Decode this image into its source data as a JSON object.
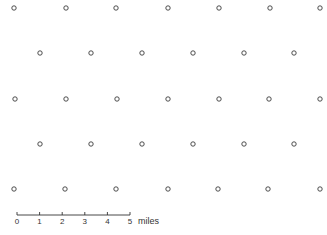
{
  "diagram": {
    "type": "point-pattern-map",
    "point_marker": "open-circle",
    "colors": {
      "point_stroke": "#3a3a3a",
      "background": "#ffffff"
    },
    "rows": [
      {
        "y": 8,
        "xs": [
          14,
          66,
          116,
          168,
          219,
          270,
          320
        ]
      },
      {
        "y": 53,
        "xs": [
          40,
          91,
          142,
          193,
          244,
          294
        ]
      },
      {
        "y": 99,
        "xs": [
          15,
          66,
          117,
          168,
          219,
          269,
          320
        ]
      },
      {
        "y": 144,
        "xs": [
          40,
          91,
          142,
          193,
          244,
          294
        ]
      },
      {
        "y": 189,
        "xs": [
          14,
          65,
          116,
          168,
          218,
          268,
          320
        ]
      }
    ]
  },
  "scale_bar": {
    "x_start": 17,
    "x_end": 130,
    "y": 215,
    "ticks": [
      "0",
      "1",
      "2",
      "3",
      "4",
      "5"
    ],
    "units": "miles"
  }
}
